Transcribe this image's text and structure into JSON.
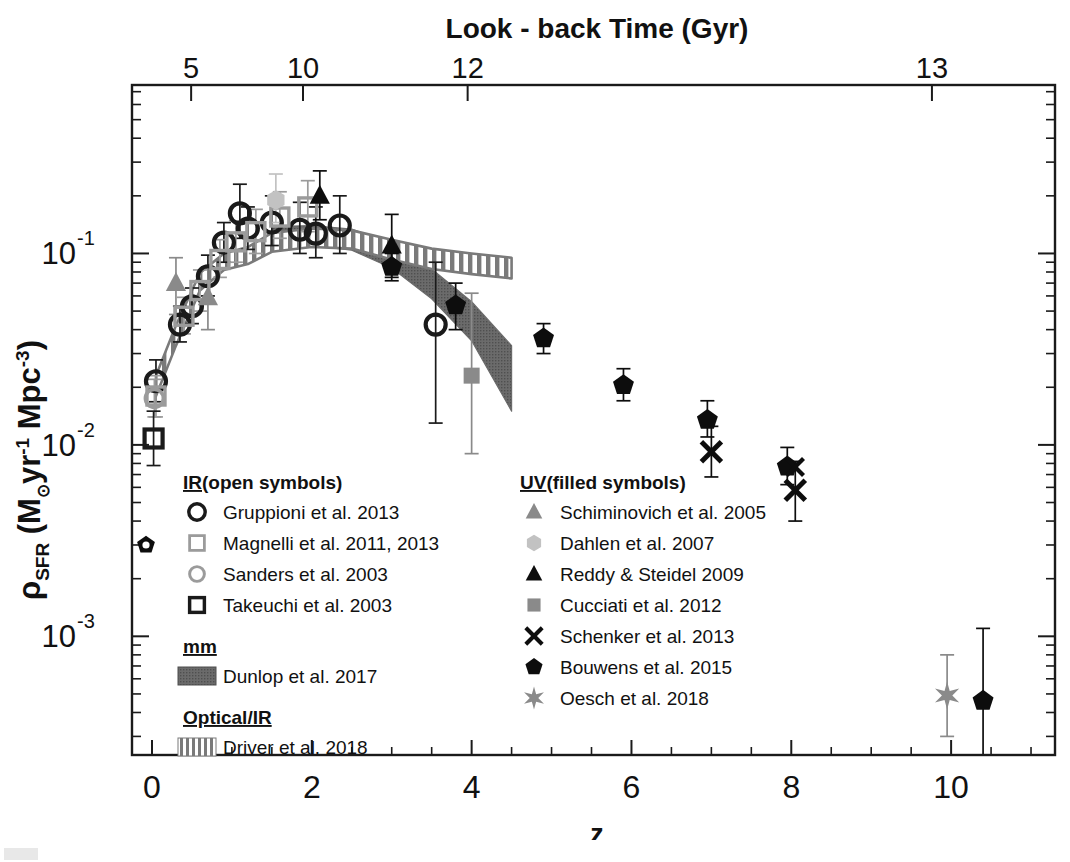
{
  "figure": {
    "top_axis_title": "Look - back Time (Gyr)",
    "bottom_axis_title": "z",
    "y_axis_title_parts": {
      "rho": "ρ",
      "sfr": "SFR",
      "open_paren": " (M",
      "sun": "⊙",
      "yr": "yr",
      "exp_minus1": "-1",
      "mpc": " Mpc",
      "exp_minus3": "-3",
      "close_paren": ")"
    },
    "y_axis_title_plain": "ρ_SFR (M⊙ yr^-1 Mpc^-3)"
  },
  "chart_data": {
    "type": "scatter",
    "title": "",
    "xlabel": "z",
    "ylabel": "ρ_SFR (M⊙ yr^-1 Mpc^-3)",
    "xlim": [
      -0.25,
      11.3
    ],
    "ylim_log": [
      -3.62,
      -0.12
    ],
    "xscale": "linear",
    "yscale": "log",
    "grid": false,
    "legend_position": "inside-bottom-left and inside-bottom-center",
    "top_axis": {
      "label": "Look - back Time (Gyr)",
      "ticks": [
        5,
        10,
        12,
        13
      ],
      "tick_labels": [
        "5",
        "10",
        "12",
        "13"
      ],
      "tick_z_positions": [
        0.49,
        1.89,
        3.95,
        9.76
      ]
    },
    "bottom_axis": {
      "ticks": [
        0,
        2,
        4,
        6,
        8,
        10
      ],
      "tick_labels": [
        "0",
        "2",
        "4",
        "6",
        "8",
        "10"
      ],
      "minor_step": 0.5
    },
    "y_axis": {
      "major_ticks": [
        0.1,
        0.01,
        0.001
      ],
      "tick_labels": [
        "10-1",
        "10-2",
        "10-3"
      ],
      "tick_exponents": [
        "-1",
        "-2",
        "-3"
      ]
    },
    "series": [
      {
        "name": "Gruppioni et al. 2013",
        "marker": "open-circle",
        "color": "#1a1a1a",
        "group": "IR",
        "points": [
          {
            "z": 0.05,
            "y": 0.0215,
            "ylo": 0.0168,
            "yhi": 0.0278
          },
          {
            "z": 0.35,
            "y": 0.0425,
            "ylo": 0.0345,
            "yhi": 0.053
          },
          {
            "z": 0.5,
            "y": 0.053,
            "ylo": 0.043,
            "yhi": 0.066
          },
          {
            "z": 0.7,
            "y": 0.076,
            "ylo": 0.06,
            "yhi": 0.098
          },
          {
            "z": 0.9,
            "y": 0.114,
            "ylo": 0.09,
            "yhi": 0.145
          },
          {
            "z": 1.1,
            "y": 0.162,
            "ylo": 0.12,
            "yhi": 0.23
          },
          {
            "z": 1.2,
            "y": 0.135,
            "ylo": 0.105,
            "yhi": 0.175
          },
          {
            "z": 1.5,
            "y": 0.145,
            "ylo": 0.11,
            "yhi": 0.2
          },
          {
            "z": 1.85,
            "y": 0.133,
            "ylo": 0.1,
            "yhi": 0.185
          },
          {
            "z": 2.05,
            "y": 0.127,
            "ylo": 0.095,
            "yhi": 0.175
          },
          {
            "z": 2.35,
            "y": 0.14,
            "ylo": 0.1,
            "yhi": 0.2
          },
          {
            "z": 3.55,
            "y": 0.0425,
            "ylo": 0.013,
            "yhi": 0.09
          }
        ]
      },
      {
        "name": "Magnelli et al. 2011, 2013",
        "marker": "open-square-gray",
        "color": "#9b9b9b",
        "group": "IR",
        "points": [
          {
            "z": 0.05,
            "y": 0.018,
            "ylo": 0.014,
            "yhi": 0.023
          },
          {
            "z": 0.4,
            "y": 0.047,
            "ylo": 0.038,
            "yhi": 0.059
          },
          {
            "z": 0.6,
            "y": 0.064,
            "ylo": 0.05,
            "yhi": 0.082
          },
          {
            "z": 0.85,
            "y": 0.093,
            "ylo": 0.075,
            "yhi": 0.118
          },
          {
            "z": 1.05,
            "y": 0.115,
            "ylo": 0.09,
            "yhi": 0.148
          },
          {
            "z": 1.3,
            "y": 0.13,
            "ylo": 0.1,
            "yhi": 0.17
          },
          {
            "z": 1.6,
            "y": 0.155,
            "ylo": 0.12,
            "yhi": 0.21
          },
          {
            "z": 1.95,
            "y": 0.175,
            "ylo": 0.13,
            "yhi": 0.24
          }
        ]
      },
      {
        "name": "Sanders et al. 2003",
        "marker": "open-circle-gray",
        "color": "#9b9b9b",
        "group": "IR",
        "points": [
          {
            "z": 0.03,
            "y": 0.0175,
            "ylo": 0.014,
            "yhi": 0.022
          }
        ]
      },
      {
        "name": "Takeuchi et al. 2003",
        "marker": "open-square",
        "color": "#1a1a1a",
        "group": "IR",
        "points": [
          {
            "z": 0.02,
            "y": 0.0108,
            "ylo": 0.0078,
            "yhi": 0.015
          }
        ]
      },
      {
        "name": "Schiminovich et al. 2005",
        "marker": "filled-triangle-gray",
        "color": "#8a8a8a",
        "group": "UV",
        "points": [
          {
            "z": 0.3,
            "y": 0.07,
            "ylo": 0.048,
            "yhi": 0.095
          },
          {
            "z": 0.7,
            "y": 0.059,
            "ylo": 0.04,
            "yhi": 0.085
          }
        ]
      },
      {
        "name": "Dahlen et al. 2007",
        "marker": "filled-hex-gray",
        "color": "#c2c2c2",
        "group": "UV",
        "points": [
          {
            "z": 1.55,
            "y": 0.19,
            "ylo": 0.145,
            "yhi": 0.26
          }
        ]
      },
      {
        "name": "Reddy & Steidel 2009",
        "marker": "filled-triangle",
        "color": "#0d0d0d",
        "group": "UV",
        "points": [
          {
            "z": 2.1,
            "y": 0.2,
            "ylo": 0.15,
            "yhi": 0.27
          },
          {
            "z": 3.0,
            "y": 0.11,
            "ylo": 0.075,
            "yhi": 0.16
          }
        ]
      },
      {
        "name": "Cucciati et al. 2012",
        "marker": "filled-square-gray",
        "color": "#8a8a8a",
        "group": "UV",
        "points": [
          {
            "z": 4.0,
            "y": 0.023,
            "ylo": 0.009,
            "yhi": 0.062
          }
        ]
      },
      {
        "name": "Schenker et al. 2013",
        "marker": "cross-x",
        "color": "#0d0d0d",
        "group": "UV",
        "points": [
          {
            "z": 7.0,
            "y": 0.0092,
            "ylo": 0.0068,
            "yhi": 0.0125
          },
          {
            "z": 8.05,
            "y": 0.0058,
            "ylo": 0.004,
            "yhi": 0.0082
          }
        ]
      },
      {
        "name": "Bouwens et al. 2015",
        "marker": "filled-pentagon",
        "color": "#0d0d0d",
        "group": "UV",
        "points": [
          {
            "z": 3.0,
            "y": 0.085,
            "ylo": 0.072,
            "yhi": 0.1
          },
          {
            "z": 3.8,
            "y": 0.0535,
            "ylo": 0.04,
            "yhi": 0.07
          },
          {
            "z": 4.9,
            "y": 0.036,
            "ylo": 0.03,
            "yhi": 0.043
          },
          {
            "z": 5.9,
            "y": 0.0205,
            "ylo": 0.017,
            "yhi": 0.025
          },
          {
            "z": 6.95,
            "y": 0.0135,
            "ylo": 0.011,
            "yhi": 0.017
          },
          {
            "z": 7.95,
            "y": 0.0077,
            "ylo": 0.0062,
            "yhi": 0.0097
          },
          {
            "z": 10.4,
            "y": 0.00046,
            "ylo": 0.00018,
            "yhi": 0.0011
          }
        ]
      },
      {
        "name": "Oesch et al. 2018",
        "marker": "star-gray",
        "color": "#8a8a8a",
        "group": "UV",
        "points": [
          {
            "z": 9.95,
            "y": 0.00049,
            "ylo": 0.0003,
            "yhi": 0.0008
          }
        ]
      }
    ],
    "bands": [
      {
        "name": "Dunlop et al. 2017",
        "style": "solid-dark-band",
        "color": "#6b6b6b",
        "group": "mm",
        "upper": [
          {
            "z": 1.5,
            "y": 0.138
          },
          {
            "z": 2.0,
            "y": 0.14
          },
          {
            "z": 2.5,
            "y": 0.134
          },
          {
            "z": 3.0,
            "y": 0.113
          },
          {
            "z": 3.5,
            "y": 0.083
          },
          {
            "z": 4.0,
            "y": 0.056
          },
          {
            "z": 4.5,
            "y": 0.033
          }
        ],
        "lower": [
          {
            "z": 1.5,
            "y": 0.106
          },
          {
            "z": 2.0,
            "y": 0.11
          },
          {
            "z": 2.5,
            "y": 0.104
          },
          {
            "z": 3.0,
            "y": 0.084
          },
          {
            "z": 3.5,
            "y": 0.058
          },
          {
            "z": 4.0,
            "y": 0.035
          },
          {
            "z": 4.5,
            "y": 0.015
          }
        ]
      },
      {
        "name": "Driver et al. 2018",
        "style": "hatched-band",
        "color": "#7a7a7a",
        "group": "Optical/IR",
        "upper": [
          {
            "z": 0.05,
            "y": 0.023
          },
          {
            "z": 0.3,
            "y": 0.042
          },
          {
            "z": 0.6,
            "y": 0.079
          },
          {
            "z": 0.9,
            "y": 0.1
          },
          {
            "z": 1.2,
            "y": 0.108
          },
          {
            "z": 1.5,
            "y": 0.128
          },
          {
            "z": 2.0,
            "y": 0.135
          },
          {
            "z": 2.5,
            "y": 0.132
          },
          {
            "z": 3.0,
            "y": 0.118
          },
          {
            "z": 3.5,
            "y": 0.106
          },
          {
            "z": 4.0,
            "y": 0.1
          },
          {
            "z": 4.5,
            "y": 0.095
          }
        ],
        "lower": [
          {
            "z": 0.05,
            "y": 0.018
          },
          {
            "z": 0.3,
            "y": 0.033
          },
          {
            "z": 0.6,
            "y": 0.064
          },
          {
            "z": 0.9,
            "y": 0.082
          },
          {
            "z": 1.2,
            "y": 0.088
          },
          {
            "z": 1.5,
            "y": 0.102
          },
          {
            "z": 2.0,
            "y": 0.108
          },
          {
            "z": 2.5,
            "y": 0.106
          },
          {
            "z": 3.0,
            "y": 0.093
          },
          {
            "z": 3.5,
            "y": 0.083
          },
          {
            "z": 4.0,
            "y": 0.078
          },
          {
            "z": 4.5,
            "y": 0.074
          }
        ]
      }
    ]
  },
  "legend_left": {
    "sections": [
      {
        "heading": "IR",
        "heading_suffix": "(open symbols)",
        "underline_chars": 2,
        "items": [
          {
            "label": "Gruppioni et al. 2013",
            "marker": "open-circle",
            "color": "#1a1a1a"
          },
          {
            "label": "Magnelli et al. 2011, 2013",
            "marker": "open-square-gray",
            "color": "#9b9b9b"
          },
          {
            "label": "Sanders et al. 2003",
            "marker": "open-circle-gray",
            "color": "#9b9b9b"
          },
          {
            "label": "Takeuchi et al. 2003",
            "marker": "open-square",
            "color": "#1a1a1a"
          }
        ]
      },
      {
        "heading": "mm",
        "heading_suffix": "",
        "items": [
          {
            "label": "Dunlop et al. 2017",
            "marker": "solid-dark-band",
            "color": "#6b6b6b"
          }
        ]
      },
      {
        "heading": "Optical/IR",
        "heading_suffix": "",
        "items": [
          {
            "label": "Driver et al. 2018",
            "marker": "hatched-band",
            "color": "#7a7a7a"
          }
        ]
      }
    ]
  },
  "legend_right": {
    "sections": [
      {
        "heading": "UV",
        "heading_suffix": "(filled symbols)",
        "items": [
          {
            "label": "Schiminovich et al. 2005",
            "marker": "filled-triangle-gray",
            "color": "#8a8a8a"
          },
          {
            "label": "Dahlen et al. 2007",
            "marker": "filled-hex-gray",
            "color": "#c2c2c2"
          },
          {
            "label": "Reddy & Steidel 2009",
            "marker": "filled-triangle",
            "color": "#0d0d0d"
          },
          {
            "label": "Cucciati et al. 2012",
            "marker": "filled-square-gray",
            "color": "#8a8a8a"
          },
          {
            "label": "Schenker et al. 2013",
            "marker": "cross-x",
            "color": "#0d0d0d"
          },
          {
            "label": "Bouwens et al. 2015",
            "marker": "filled-pentagon",
            "color": "#0d0d0d"
          },
          {
            "label": "Oesch et al. 2018",
            "marker": "star-gray",
            "color": "#8a8a8a"
          }
        ]
      }
    ]
  }
}
